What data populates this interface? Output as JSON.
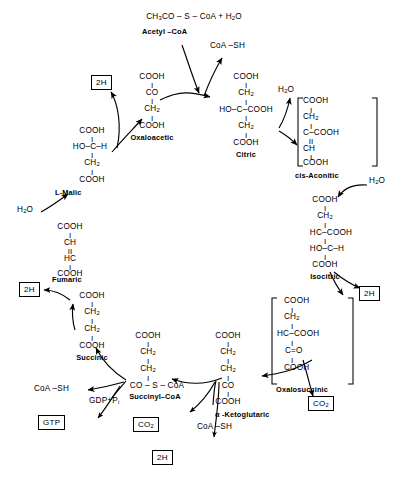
{
  "diagram": {
    "caption": "",
    "type": "biochemical-pathway-cycle"
  },
  "reactants": {
    "acetyl_coa_formula": "CH₃CO – S – CoA + H₂O",
    "acetyl_coa_label": "Acetyl –CoA",
    "coash_top": "CoA –SH",
    "water_left": "H₂O",
    "water_citric": "H₂O",
    "water_aconitic": "H₂O",
    "coash_bottom": "CoA –SH",
    "gdp_pi": "GDP+P",
    "gdp_pi_sub": "i"
  },
  "boxes": [
    {
      "id": "box-2h-oxaloacetic",
      "label": "2H"
    },
    {
      "id": "box-2h-fumaric",
      "label": "2H"
    },
    {
      "id": "box-2h-isocitric",
      "label": "2H"
    },
    {
      "id": "box-2h-ketoglutaric",
      "label": "2H"
    },
    {
      "id": "box-co2-oxalosuccinic",
      "label": "CO",
      "sub": "2"
    },
    {
      "id": "box-co2-ketoglutaric",
      "label": "CO",
      "sub": "2"
    },
    {
      "id": "box-gtp",
      "label": "GTP"
    }
  ],
  "metabolites": [
    {
      "id": "oxaloacetic",
      "name": "Oxaloacetic",
      "lines": [
        "COOH",
        "CO",
        "CH₂",
        "COOH"
      ],
      "bracketed": false
    },
    {
      "id": "citric",
      "name": "Citric",
      "lines": [
        "COOH",
        "CH₂",
        "HO–C–COOH",
        "CH₂",
        "COOH"
      ],
      "bracketed": false
    },
    {
      "id": "cis-aconitic",
      "name": "cis-Aconitic",
      "lines": [
        "COOH",
        "CH₂",
        "C–COOH",
        "CH",
        "COOH"
      ],
      "bracketed": true
    },
    {
      "id": "isocitric",
      "name": "Isocitric",
      "lines": [
        "COOH",
        "CH₂",
        "HC–COOH",
        "HO–C–H",
        "COOH"
      ],
      "bracketed": false
    },
    {
      "id": "oxalosuccinic",
      "name": "Oxalosuccinic",
      "lines": [
        "COOH",
        "CH₂",
        "HC–COOH",
        "C=O",
        "COOH"
      ],
      "bracketed": true
    },
    {
      "id": "alpha-ketoglutaric",
      "name": "α -Ketoglutaric",
      "lines": [
        "COOH",
        "CH₂",
        "CH₂",
        "CO",
        "COOH"
      ],
      "bracketed": false
    },
    {
      "id": "succinyl-coa",
      "name": "Succinyl–CoA",
      "lines": [
        "COOH",
        "CH₂",
        "CH₂",
        "CO – S – CoA"
      ],
      "bracketed": false
    },
    {
      "id": "succinic",
      "name": "Succinic",
      "lines": [
        "COOH",
        "CH₂",
        "CH₂",
        "COOH"
      ],
      "bracketed": false
    },
    {
      "id": "fumaric",
      "name": "Fumaric",
      "lines": [
        "COOH",
        "CH",
        "HC",
        "COOH"
      ],
      "bracketed": false
    },
    {
      "id": "l-malic",
      "name": "L-Malic",
      "lines": [
        "COOH",
        "HO–C–H",
        "CH₂",
        "COOH"
      ],
      "bracketed": false
    }
  ],
  "atoms": {
    "COOH": "COOH",
    "CH2": "CH",
    "CH2sub": "2",
    "CO": "CO",
    "CH": "CH",
    "HC": "HC",
    "HO_C_COOH": "HO–C–COOH",
    "C_COOH": "C–COOH",
    "HC_COOH": "HC–COOH",
    "HO_C_H": "HO–C–H",
    "C_eq_O": "C=O",
    "CO_S_CoA": "CO – S – CoA",
    "bond_single": "I",
    "bond_double": "II"
  },
  "colors": {
    "ink": "#000000",
    "paper": "#ffffff"
  }
}
